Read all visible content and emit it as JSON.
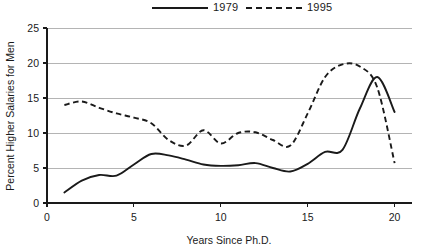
{
  "chart_data": {
    "type": "line",
    "title": "",
    "xlabel": "Years Since Ph.D.",
    "ylabel": "Percent Higher Salaries for Men",
    "xlim": [
      0,
      21
    ],
    "ylim": [
      0,
      25
    ],
    "xticks": [
      0,
      5,
      10,
      15,
      20
    ],
    "yticks": [
      0,
      5,
      10,
      15,
      20,
      25
    ],
    "xtick_labels": [
      "0",
      "5",
      "10",
      "15",
      "20"
    ],
    "ytick_labels": [
      "0",
      "5",
      "10",
      "15",
      "20",
      "25"
    ],
    "grid": "horizontal",
    "legend_position": "top-center",
    "x": [
      1,
      2,
      3,
      4,
      5,
      6,
      7,
      8,
      9,
      10,
      11,
      12,
      13,
      14,
      15,
      16,
      17,
      18,
      19,
      20
    ],
    "series": [
      {
        "name": "1979",
        "style": "solid",
        "color": "#1a1a1a",
        "values": [
          1.5,
          3.2,
          4.0,
          3.9,
          5.5,
          7.0,
          6.8,
          6.2,
          5.5,
          5.3,
          5.4,
          5.7,
          5.0,
          4.5,
          5.6,
          7.3,
          7.6,
          13.5,
          18.0,
          13.0
        ]
      },
      {
        "name": "1995",
        "style": "dashed",
        "color": "#1a1a1a",
        "values": [
          14.0,
          14.5,
          13.6,
          12.8,
          12.2,
          11.4,
          9.0,
          8.2,
          10.4,
          8.5,
          10.0,
          10.1,
          9.0,
          8.2,
          12.8,
          18.0,
          19.8,
          19.5,
          16.5,
          5.7
        ]
      }
    ]
  },
  "legend": {
    "items": [
      {
        "label": "1979",
        "style": "solid"
      },
      {
        "label": "1995",
        "style": "dashed"
      }
    ]
  },
  "axes": {
    "y_title": "Percent Higher Salaries for Men",
    "x_title": "Years Since Ph.D."
  }
}
